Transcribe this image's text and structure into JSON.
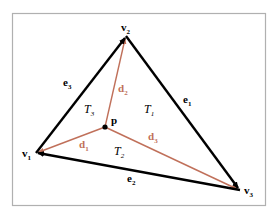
{
  "diagram": {
    "colors": {
      "edge": "#000000",
      "distance_vector": "#c0705a",
      "label_edge": "#000000",
      "label_distance": "#c0705a",
      "frame": "#b0b0b0"
    },
    "vertices": [
      {
        "id": "v1",
        "base": "v",
        "sub": "1",
        "x": 36,
        "y": 153
      },
      {
        "id": "v2",
        "base": "v",
        "sub": "2",
        "x": 126,
        "y": 36
      },
      {
        "id": "v3",
        "base": "v",
        "sub": "3",
        "x": 240,
        "y": 190
      }
    ],
    "point": {
      "id": "p",
      "label": "p",
      "x": 105,
      "y": 127
    },
    "edges": [
      {
        "id": "e1",
        "base": "e",
        "sub": "1"
      },
      {
        "id": "e2",
        "base": "e",
        "sub": "2"
      },
      {
        "id": "e3",
        "base": "e",
        "sub": "3"
      }
    ],
    "distances": [
      {
        "id": "d1",
        "base": "d",
        "sub": "1"
      },
      {
        "id": "d2",
        "base": "d",
        "sub": "2"
      },
      {
        "id": "d3",
        "base": "d",
        "sub": "3"
      }
    ],
    "regions": [
      {
        "id": "T1",
        "base": "T",
        "sub": "1"
      },
      {
        "id": "T2",
        "base": "T",
        "sub": "2"
      },
      {
        "id": "T3",
        "base": "T",
        "sub": "3"
      }
    ]
  }
}
